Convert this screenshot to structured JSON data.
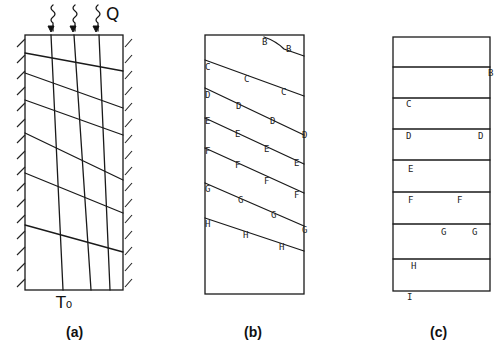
{
  "figure": {
    "panels": [
      {
        "id": "a",
        "caption": "(a)",
        "heat_flux_label": "Q",
        "bottom_label": "T₀",
        "box": {
          "x": 25,
          "y": 35,
          "w": 98,
          "h": 255
        },
        "arrows_x": [
          51,
          73,
          96
        ],
        "vertical_lines": [
          {
            "x1": 51,
            "y1": 35,
            "x2": 63,
            "y2": 290
          },
          {
            "x1": 74,
            "y1": 35,
            "x2": 91,
            "y2": 290
          },
          {
            "x1": 99,
            "y1": 35,
            "x2": 110,
            "y2": 290
          }
        ],
        "slanted_lines": [
          {
            "y_left": 53,
            "y_right": 71
          },
          {
            "y_left": 73,
            "y_right": 108
          },
          {
            "y_left": 100,
            "y_right": 135
          },
          {
            "y_left": 133,
            "y_right": 180
          },
          {
            "y_left": 173,
            "y_right": 213
          },
          {
            "y_left": 225,
            "y_right": 252
          }
        ]
      },
      {
        "id": "b",
        "caption": "(b)",
        "box": {
          "x": 205,
          "y": 35,
          "w": 99,
          "h": 259
        },
        "lines": [
          {
            "label": "B",
            "x_start": 264,
            "y_start": 37,
            "y_right": 56,
            "labels": [
              {
                "x": 262,
                "y": 45
              },
              {
                "x": 286,
                "y": 52
              }
            ]
          },
          {
            "label": "C",
            "y_left": 60,
            "y_right": 96,
            "labels": [
              {
                "x": 205,
                "y": 70
              },
              {
                "x": 244,
                "y": 82
              },
              {
                "x": 281,
                "y": 95
              }
            ]
          },
          {
            "label": "D",
            "y_left": 88,
            "y_right": 135,
            "labels": [
              {
                "x": 205,
                "y": 98
              },
              {
                "x": 236,
                "y": 109
              },
              {
                "x": 270,
                "y": 124
              },
              {
                "x": 302,
                "y": 138
              }
            ]
          },
          {
            "label": "E",
            "y_left": 118,
            "y_right": 164,
            "labels": [
              {
                "x": 205,
                "y": 124
              },
              {
                "x": 235,
                "y": 137
              },
              {
                "x": 264,
                "y": 152
              },
              {
                "x": 294,
                "y": 166
              }
            ]
          },
          {
            "label": "F",
            "y_left": 148,
            "y_right": 193,
            "labels": [
              {
                "x": 205,
                "y": 154
              },
              {
                "x": 235,
                "y": 168
              },
              {
                "x": 264,
                "y": 184
              },
              {
                "x": 294,
                "y": 198
              }
            ]
          },
          {
            "label": "G",
            "y_left": 183,
            "y_right": 226,
            "labels": [
              {
                "x": 205,
                "y": 192
              },
              {
                "x": 238,
                "y": 203
              },
              {
                "x": 271,
                "y": 218
              },
              {
                "x": 302,
                "y": 233
              }
            ]
          },
          {
            "label": "H",
            "y_left": 218,
            "y_right": 251,
            "labels": [
              {
                "x": 205,
                "y": 227
              },
              {
                "x": 243,
                "y": 238
              },
              {
                "x": 279,
                "y": 250
              }
            ]
          }
        ]
      },
      {
        "id": "c",
        "caption": "(c)",
        "box": {
          "x": 393,
          "y": 37,
          "w": 97,
          "h": 254
        },
        "horizontal_lines_y": [
          67,
          98,
          129,
          160,
          192,
          224,
          259
        ],
        "labels": [
          {
            "text": "B",
            "x": 488,
            "y": 76
          },
          {
            "text": "C",
            "x": 406,
            "y": 107
          },
          {
            "text": "D",
            "x": 406,
            "y": 139
          },
          {
            "text": "D",
            "x": 478,
            "y": 139
          },
          {
            "text": "E",
            "x": 408,
            "y": 172
          },
          {
            "text": "F",
            "x": 408,
            "y": 203
          },
          {
            "text": "F",
            "x": 457,
            "y": 203
          },
          {
            "text": "G",
            "x": 441,
            "y": 235
          },
          {
            "text": "G",
            "x": 472,
            "y": 235
          },
          {
            "text": "H",
            "x": 411,
            "y": 269
          },
          {
            "text": "I",
            "x": 407,
            "y": 300
          }
        ]
      }
    ]
  }
}
